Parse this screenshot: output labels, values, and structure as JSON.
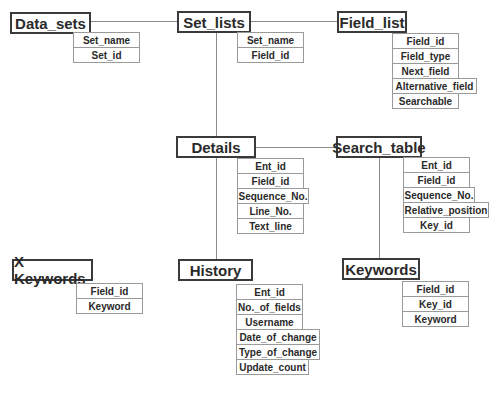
{
  "entities": {
    "data_sets": {
      "title": "Data_sets",
      "fields": [
        "Set_name",
        "Set_id"
      ]
    },
    "set_lists": {
      "title": "Set_lists",
      "fields": [
        "Set_name",
        "Field_id"
      ]
    },
    "field_list": {
      "title": "Field_list",
      "fields": [
        "Field_id",
        "Field_type",
        "Next_field",
        "Alternative_field",
        "Searchable"
      ]
    },
    "details": {
      "title": "Details",
      "fields": [
        "Ent_id",
        "Field_id",
        "Sequence_No.",
        "Line_No.",
        "Text_line"
      ]
    },
    "search_table": {
      "title": "Search_table",
      "fields": [
        "Ent_id",
        "Field_id",
        "Sequence_No.",
        "Relative_position",
        "Key_id"
      ]
    },
    "x_keywords": {
      "title": "X Keywords",
      "fields": [
        "Field_id",
        "Keyword"
      ]
    },
    "history": {
      "title": "History",
      "fields": [
        "Ent_id",
        "No._of_fields",
        "Username",
        "Date_of_change",
        "Type_of_change",
        "Update_count"
      ]
    },
    "keywords": {
      "title": "Keywords",
      "fields": [
        "Field_id",
        "Key_id",
        "Keyword"
      ]
    }
  },
  "connections": [
    [
      "Data_sets",
      "Set_lists"
    ],
    [
      "Set_lists",
      "Field_list"
    ],
    [
      "Set_lists",
      "Details"
    ],
    [
      "Details",
      "Search_table"
    ],
    [
      "Details",
      "History"
    ],
    [
      "Search_table",
      "Keywords"
    ]
  ],
  "colors": {
    "line": "#8a8a8a",
    "border": "#3a3a3a",
    "text": "#2a2a2a"
  }
}
